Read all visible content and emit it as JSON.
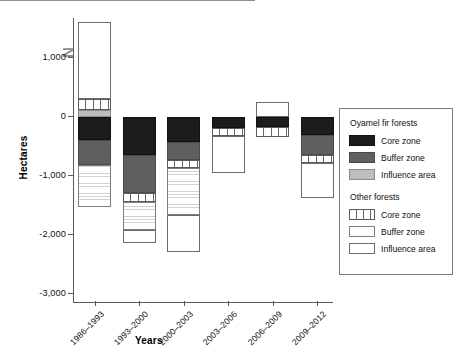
{
  "chart_data": {
    "type": "bar",
    "title": "",
    "xlabel": "Years",
    "ylabel": "Hectares",
    "ylim": [
      -3000,
      3000
    ],
    "ytick_labels": [
      "3,000",
      "1,000",
      "0",
      "-1,000",
      "-2,000",
      "-3,000"
    ],
    "ytick_values": [
      3000,
      1000,
      0,
      -1000,
      -2000,
      -3000
    ],
    "grid": false,
    "legend_position": "right",
    "stacked": true,
    "orientation": "vertical",
    "categories": [
      "1986–1993",
      "1993–2000",
      "2000–2003",
      "2003–2006",
      "2006–2009",
      "2009–2012"
    ],
    "series": [
      {
        "name": "Oyamel fir forests – Core zone",
        "key": "oyamel-core",
        "color": "#1c1c1c",
        "values": [
          -390,
          -645,
          -425,
          -190,
          -170,
          -305
        ]
      },
      {
        "name": "Oyamel fir forests – Buffer zone",
        "key": "oyamel-buffer",
        "color": "#5f5f5f",
        "values": [
          -425,
          -645,
          -305,
          0,
          0,
          -340
        ]
      },
      {
        "name": "Oyamel fir forests – Influence area",
        "key": "oyamel-influence",
        "color": "#bdbdbd",
        "values": [
          120,
          0,
          0,
          0,
          0,
          0
        ]
      },
      {
        "name": "Other forests – Core zone",
        "key": "other-core",
        "color": "#ffffff",
        "values": [
          170,
          -150,
          -135,
          -135,
          -170,
          -135
        ]
      },
      {
        "name": "Other forests – Buffer zone",
        "key": "other-buffer",
        "color": "#fdfdfd",
        "values": [
          -710,
          -475,
          -795,
          0,
          0,
          0
        ]
      },
      {
        "name": "Other forests – Influence area",
        "key": "other-influence",
        "color": "#ffffff",
        "values": [
          1320,
          -220,
          -630,
          -625,
          240,
          -595
        ]
      }
    ],
    "annotations": [
      {
        "text": "N",
        "note": "north arrow marker"
      }
    ]
  },
  "axes": {
    "y_title": "Hectares",
    "x_title": "Years",
    "yticks": [
      {
        "label": "3,000",
        "value": 3000
      },
      {
        "label": "1,000",
        "value": 1000
      },
      {
        "label": "0",
        "value": 0
      },
      {
        "label": "-1,000",
        "value": -1000
      },
      {
        "label": "-2,000",
        "value": -2000
      },
      {
        "label": "-3,000",
        "value": -3000
      }
    ],
    "xticks": [
      {
        "label": "1986–1993"
      },
      {
        "label": "1993–2000"
      },
      {
        "label": "2000–2003"
      },
      {
        "label": "2003–2006"
      },
      {
        "label": "2006–2009"
      },
      {
        "label": "2009–2012"
      }
    ]
  },
  "north_marker": {
    "label": "N"
  },
  "legend": {
    "groups": [
      {
        "title": "Oyamel fir forests",
        "entries": [
          {
            "label": "Core zone",
            "key": "oyamel-core"
          },
          {
            "label": "Buffer zone",
            "key": "oyamel-buffer"
          },
          {
            "label": "Influence area",
            "key": "oyamel-influence"
          }
        ]
      },
      {
        "title": "Other forests",
        "entries": [
          {
            "label": "Core zone",
            "key": "other-core"
          },
          {
            "label": "Buffer zone",
            "key": "other-buffer"
          },
          {
            "label": "Influence area",
            "key": "other-influence"
          }
        ]
      }
    ]
  }
}
